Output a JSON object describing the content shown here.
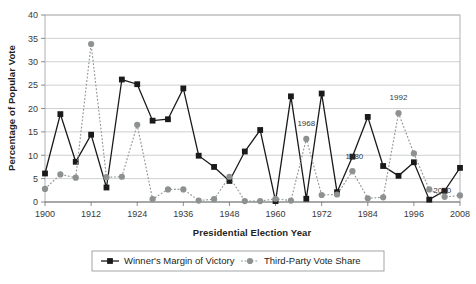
{
  "chart_data": {
    "type": "line",
    "title": "",
    "xlabel": "Presidential Election Year",
    "ylabel": "Percentage of Popular Vote",
    "xlim": [
      1900,
      2008
    ],
    "ylim": [
      0,
      40
    ],
    "ytick_step": 5,
    "yticks": [
      "0",
      "5",
      "10",
      "15",
      "20",
      "25",
      "30",
      "35",
      "40"
    ],
    "xticks": [
      "1900",
      "1912",
      "1924",
      "1936",
      "1948",
      "1960",
      "1972",
      "1984",
      "1996",
      "2008"
    ],
    "grid": "horizontal",
    "legend_position": "bottom-center",
    "x": [
      1900,
      1904,
      1908,
      1912,
      1916,
      1920,
      1924,
      1928,
      1932,
      1936,
      1940,
      1944,
      1948,
      1952,
      1956,
      1960,
      1964,
      1968,
      1972,
      1976,
      1980,
      1984,
      1988,
      1992,
      1996,
      2000,
      2004,
      2008
    ],
    "series": [
      {
        "name": "Winner's Margin of Victory",
        "color": "#1a1a1a",
        "marker": "square",
        "linestyle": "solid",
        "values": [
          6.1,
          18.8,
          8.6,
          14.4,
          3.1,
          26.2,
          25.2,
          17.4,
          17.7,
          24.3,
          9.9,
          7.5,
          4.5,
          10.8,
          15.4,
          0.2,
          22.6,
          0.7,
          23.2,
          2.1,
          9.7,
          18.2,
          7.7,
          5.6,
          8.5,
          0.5,
          2.4,
          7.3
        ]
      },
      {
        "name": "Third-Party Vote Share",
        "color": "#8e9192",
        "marker": "circle",
        "linestyle": "dotted",
        "values": [
          2.8,
          5.9,
          5.2,
          33.8,
          5.3,
          5.4,
          16.5,
          0.6,
          2.7,
          2.7,
          0.3,
          0.6,
          5.4,
          0.2,
          0.2,
          0.7,
          0.3,
          13.5,
          1.5,
          1.6,
          6.6,
          0.8,
          1.0,
          19.0,
          10.4,
          2.7,
          1.1,
          1.4
        ]
      }
    ],
    "annotations": [
      {
        "label": "1968",
        "x": 1968,
        "y": 13.5
      },
      {
        "label": "1980",
        "x": 1980,
        "y": 6.6
      },
      {
        "label": "1992",
        "x": 1992,
        "y": 19.0
      },
      {
        "label": "2000",
        "x": 2000,
        "y": 2.7
      }
    ]
  }
}
